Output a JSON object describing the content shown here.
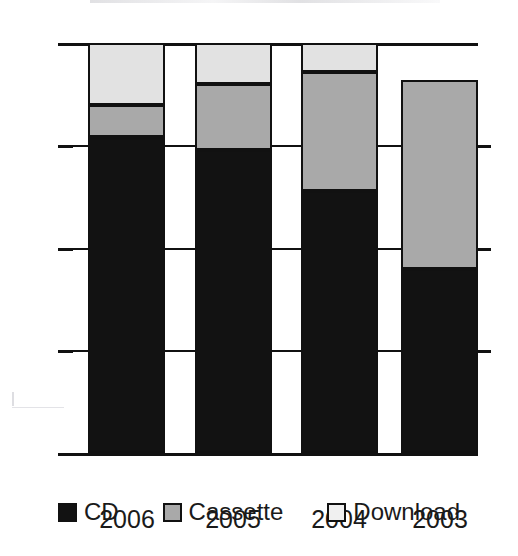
{
  "chart_data": {
    "type": "bar",
    "subtype": "stacked-bar",
    "title": "",
    "xlabel": "",
    "ylabel": "",
    "ylim": [
      0,
      100
    ],
    "yticks": [
      0,
      25,
      50,
      75,
      100
    ],
    "ytick_labels": [
      "0",
      "25",
      "50",
      "75",
      "100"
    ],
    "grid": true,
    "legend_position": "bottom",
    "categories": [
      "2006",
      "2005",
      "2004",
      "2003"
    ],
    "series": [
      {
        "name": "CD",
        "color": "#121212",
        "values": [
          77,
          74,
          64,
          45
        ]
      },
      {
        "name": "Cassette",
        "color": "#a9a9a9",
        "values": [
          8,
          16,
          29,
          46
        ]
      },
      {
        "name": "Download",
        "color": "#e2e2e2",
        "values": [
          15,
          10,
          7,
          0
        ]
      }
    ],
    "stack_tops": {
      "2006": {
        "cd": 77,
        "cassette": 85,
        "download": 100
      },
      "2005": {
        "cd": 74,
        "cassette": 90,
        "download": 100
      },
      "2004": {
        "cd": 64,
        "cassette": 93,
        "download": 100
      },
      "2003": {
        "cd": 45,
        "cassette": 91,
        "download": 91
      }
    }
  },
  "axis": {
    "y_tick_0": "0",
    "y_tick_25": "25",
    "y_tick_50": "50",
    "y_tick_75": "75",
    "y_tick_100": "100"
  },
  "xaxis": {
    "label_0": "2006",
    "label_1": "2005",
    "label_2": "2004",
    "label_3": "2003"
  },
  "legend": {
    "items": [
      {
        "label": "CD"
      },
      {
        "label": "Cassette"
      },
      {
        "label": "Download"
      }
    ]
  },
  "colors": {
    "cd": "#121212",
    "cassette": "#a9a9a9",
    "download": "#e2e2e2",
    "axis": "#111111",
    "background": "#ffffff"
  }
}
